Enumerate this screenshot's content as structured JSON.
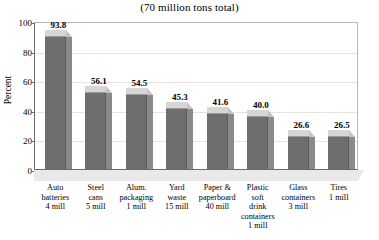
{
  "chart_data": {
    "type": "bar",
    "title": "(70 million tons total)",
    "xlabel": "",
    "ylabel": "Percent",
    "ylim": [
      0,
      100
    ],
    "yticks": [
      0,
      20,
      40,
      60,
      80,
      100
    ],
    "grid": true,
    "legend": null,
    "categories": [
      "Auto batteries 4 mill",
      "Steel cans 5 mill",
      "Alum. packaging 1 mill",
      "Yard waste 15 mill",
      "Paper & paperboard 40 mill",
      "Plastic soft drink containers 1 mill",
      "Glass containers 3 mill",
      "Tires 1 mill"
    ],
    "values": [
      93.8,
      56.1,
      54.5,
      45.3,
      41.6,
      40.0,
      26.6,
      26.5
    ],
    "value_labels": [
      "93.8",
      "56.1",
      "54.5",
      "45.3",
      "41.6",
      "40.0",
      "26.6",
      "26.5"
    ],
    "category_lines": [
      [
        "Auto",
        "batteries",
        "4 mill"
      ],
      [
        "Steel",
        "cans",
        "5 mill"
      ],
      [
        "Alum.",
        "packaging",
        "1 mill"
      ],
      [
        "Yard",
        "waste",
        "15 mill"
      ],
      [
        "Paper &",
        "paperboard",
        "40 mill"
      ],
      [
        "Plastic",
        "soft",
        "drink",
        "containers",
        "1 mill"
      ],
      [
        "Glass",
        "containers",
        "3 mill"
      ],
      [
        "Tires",
        "1 mill"
      ]
    ],
    "colors": {
      "bar_front": "#6e6e6e",
      "bar_top": "#d6d6d6",
      "bar_side": "#8a8a8a",
      "floor": "#e9e9e9",
      "gridline": "#e4e4e4",
      "axis": "#6a6a6a",
      "text": "#000000",
      "background": "#ffffff"
    }
  }
}
